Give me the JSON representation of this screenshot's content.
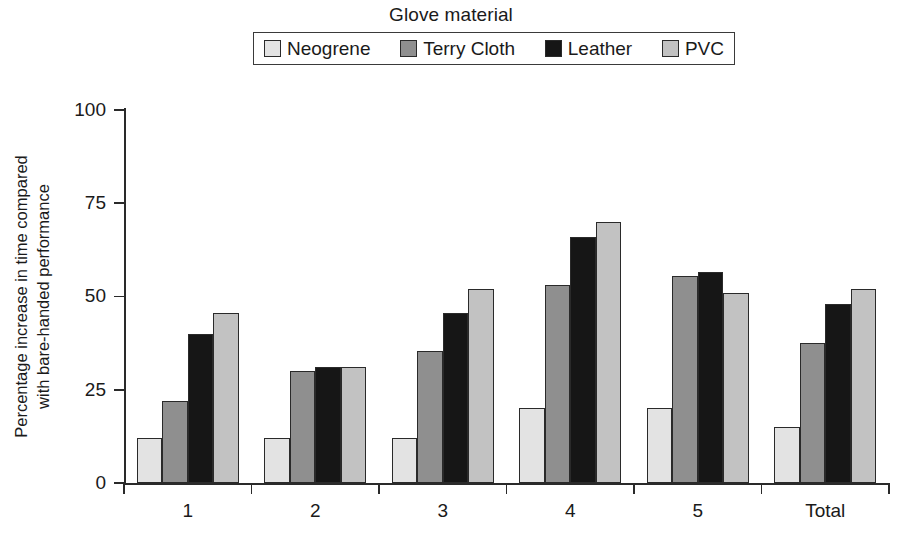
{
  "legend": {
    "title": "Glove material",
    "items": [
      {
        "label": "Neogrene",
        "color": "#e3e3e3"
      },
      {
        "label": "Terry Cloth",
        "color": "#8f8f8f"
      },
      {
        "label": "Leather",
        "color": "#161616"
      },
      {
        "label": "PVC",
        "color": "#c2c2c2"
      }
    ]
  },
  "axes": {
    "y_title": "Percentage increase in time compared\nwith bare-handed performance",
    "y_ticks": [
      "0",
      "25",
      "50",
      "75",
      "100"
    ],
    "x_labels": [
      "1",
      "2",
      "3",
      "4",
      "5",
      "Total"
    ]
  },
  "chart_data": {
    "type": "bar",
    "title": "",
    "legend_title": "Glove material",
    "legend_position": "top-center",
    "xlabel": "",
    "ylabel": "Percentage increase in time compared with bare-handed performance",
    "categories": [
      "1",
      "2",
      "3",
      "4",
      "5",
      "Total"
    ],
    "ylim": [
      0,
      100
    ],
    "yticks": [
      0,
      25,
      50,
      75,
      100
    ],
    "grid": false,
    "series": [
      {
        "name": "Neogrene",
        "color": "#e3e3e3",
        "values": [
          12,
          12,
          12,
          20,
          20,
          15
        ]
      },
      {
        "name": "Terry Cloth",
        "color": "#8f8f8f",
        "values": [
          22,
          30,
          35.5,
          53,
          55.5,
          37.5
        ]
      },
      {
        "name": "Leather",
        "color": "#161616",
        "values": [
          40,
          31,
          45.5,
          66,
          56.5,
          48
        ]
      },
      {
        "name": "PVC",
        "color": "#c2c2c2",
        "values": [
          45.5,
          31,
          52,
          70,
          51,
          52
        ]
      }
    ]
  }
}
